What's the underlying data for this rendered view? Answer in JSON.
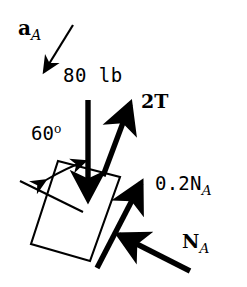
{
  "figure": {
    "type": "free-body-diagram",
    "background_color": "#ffffff",
    "ink_color": "#000000",
    "width": 247,
    "height": 287,
    "labels": {
      "acceleration": {
        "symbol": "a",
        "subscript": "A",
        "style": "bold-italic-subscript"
      },
      "weight": {
        "text": "80 lb"
      },
      "tension": {
        "text": "2T"
      },
      "angle": {
        "value": "60",
        "unit": "o"
      },
      "friction": {
        "prefix": "0.2N",
        "subscript": "A"
      },
      "normal": {
        "symbol": "N",
        "subscript": "A"
      }
    },
    "vectors": [
      {
        "name": "a_A",
        "label": "a_A",
        "x1": 72,
        "y1": 26,
        "x2": 41,
        "y2": 76,
        "weight": "thin",
        "head": "end"
      },
      {
        "name": "weight",
        "label": "80 lb",
        "x1": 88,
        "y1": 100,
        "x2": 88,
        "y2": 206,
        "weight": "thick",
        "head": "end"
      },
      {
        "name": "tension",
        "label": "2T",
        "x1": 103,
        "y1": 176,
        "x2": 133,
        "y2": 96,
        "weight": "thick",
        "head": "end"
      },
      {
        "name": "friction",
        "label": "0.2N_A",
        "x1": 97,
        "y1": 268,
        "x2": 144,
        "y2": 176,
        "weight": "thick",
        "head": "end"
      },
      {
        "name": "normal",
        "label": "N_A",
        "x1": 190,
        "y1": 271,
        "x2": 113,
        "y2": 232,
        "weight": "thick",
        "head": "end"
      }
    ],
    "block": {
      "name": "block-A",
      "corners": [
        [
          58,
          161
        ],
        [
          120,
          177
        ],
        [
          90,
          261
        ],
        [
          31,
          244
        ]
      ],
      "fill": "none",
      "stroke": "#000000"
    },
    "incline_reference_line": {
      "x1": 22,
      "y1": 182,
      "x2": 81,
      "y2": 211
    },
    "angle_arc": {
      "center_x": 84,
      "center_y": 158,
      "radius": 55,
      "double_headed": true
    }
  }
}
